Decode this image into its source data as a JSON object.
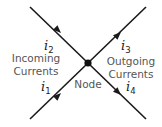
{
  "diagram": {
    "colors": {
      "line": "#1a1a1a",
      "label": "#555555",
      "current": "#222222",
      "background": "#ffffff"
    },
    "node": {
      "label": "Node"
    },
    "groups": {
      "incoming": {
        "line1": "Incoming",
        "line2": "Currents"
      },
      "outgoing": {
        "line1": "Outgoing",
        "line2": "Currents"
      }
    },
    "currents": [
      {
        "symbol": "i",
        "sub": "1",
        "direction": "incoming"
      },
      {
        "symbol": "i",
        "sub": "2",
        "direction": "incoming"
      },
      {
        "symbol": "i",
        "sub": "3",
        "direction": "outgoing"
      },
      {
        "symbol": "i",
        "sub": "4",
        "direction": "outgoing"
      }
    ]
  }
}
